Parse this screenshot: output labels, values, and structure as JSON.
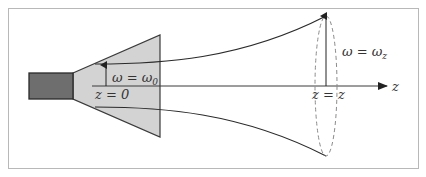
{
  "diagram": {
    "colors": {
      "frame": "#b8b8b8",
      "feed": "#6e6e6e",
      "feed_stroke": "#2a2a2a",
      "horn_fill": "#d3d3d3",
      "horn_stroke": "#3a3a3a",
      "beam": "#2a2a2a",
      "axis": "#3a3a3a",
      "ellipse": "#8a8a8a"
    },
    "labels": {
      "waist_omega": "ω = ω",
      "waist_sub": "0",
      "waist_z": "z = 0",
      "far_omega": "ω = ω",
      "far_sub": "z",
      "far_z": "z = z",
      "axis": "z"
    },
    "components": [
      {
        "name": "feed-waveguide",
        "label": ""
      },
      {
        "name": "horn",
        "label": ""
      },
      {
        "name": "beam-envelope",
        "label": ""
      },
      {
        "name": "beam-cross-section",
        "label": ""
      },
      {
        "name": "propagation-axis",
        "label": "z"
      }
    ]
  }
}
